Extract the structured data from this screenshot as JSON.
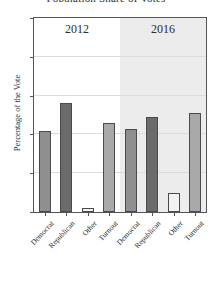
{
  "chart_data": {
    "type": "bar",
    "title": "Population Share of Votes",
    "xlabel": "",
    "ylabel": "Percentage of the Vote",
    "ylim": [
      0,
      100
    ],
    "yticks": [
      0,
      20,
      40,
      60,
      80,
      100
    ],
    "ytick_labels": [
      "0",
      "20",
      "40",
      "60",
      "80",
      "100"
    ],
    "grid": true,
    "legend": "none",
    "panels": [
      {
        "label": "2012",
        "shaded": false,
        "categories": [
          "Democrat",
          "Republican",
          "Other",
          "Turnout"
        ],
        "values": [
          42,
          56,
          2,
          46
        ]
      },
      {
        "label": "2016",
        "shaded": true,
        "categories": [
          "Democrat",
          "Republican",
          "Other",
          "Turnout"
        ],
        "values": [
          43,
          49,
          10,
          51
        ]
      }
    ],
    "series_colors": {
      "Democrat": "#8f8f8f",
      "Republican": "#6b6b6b",
      "Other": "#f2f2f2",
      "Turnout": "#a9a9a9"
    },
    "panel_shade_color": "#ececec",
    "axis_color": "#555555",
    "grid_color": "#dcdcdc",
    "text_color": "#2b2b2b"
  }
}
